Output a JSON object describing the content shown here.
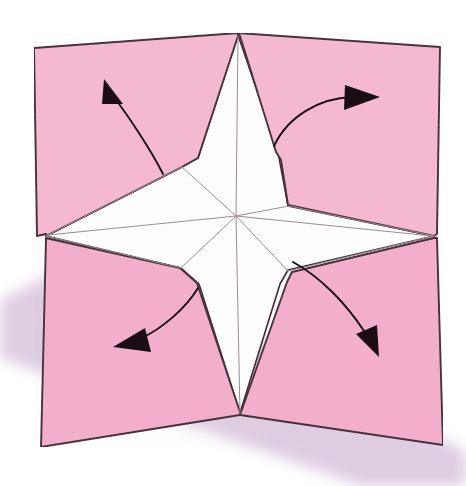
{
  "figure": {
    "kind": "origami-instruction-diagram",
    "width": 466,
    "height": 486
  },
  "colors": {
    "background": "#ffffff",
    "paper_front": "#f6b8d2",
    "paper_front_alt": "#f4aecb",
    "paper_back": "#ffffff",
    "outline": "#3d2330",
    "crease_line": "#9a8d94",
    "arrow": "#1a0d14",
    "shadow": "#d9c4dd"
  },
  "shadow": {
    "name": "drop-shadow-band",
    "points": "0,300 96,252 466,452 466,486 360,486 0,358"
  },
  "paper": {
    "corners": {
      "top_left": [
        34,
        48
      ],
      "top_center": [
        238,
        33
      ],
      "top_right": [
        440,
        47
      ],
      "right_mid": [
        434,
        236
      ],
      "bottom_right": [
        443,
        445
      ],
      "bottom_center": [
        240,
        415
      ],
      "bottom_left": [
        41,
        447
      ],
      "left_mid": [
        46,
        236
      ],
      "center": [
        236,
        216
      ]
    },
    "flaps": [
      {
        "name": "flap-top-left",
        "points": "34,48 238,33 238,36 198,158 180,168 46,236 46,234 37,236"
      },
      {
        "name": "flap-top-right",
        "points": "238,33 440,47 437,234 434,236 288,205 281,160 276,152 240,36"
      },
      {
        "name": "flap-bottom-left",
        "points": "46,238 180,268 197,283 240,412 240,415 41,447"
      },
      {
        "name": "flap-bottom-right",
        "points": "434,238 437,238 443,445 240,415 241,412 287,282 292,272"
      }
    ],
    "star": {
      "name": "white-star",
      "points": "238,35 278,152 288,206 434,236 288,270 280,284 240,413 199,284 181,268 46,236 180,168 198,158"
    },
    "creases": [
      {
        "name": "crease-vertical-top",
        "from": [
          238,
          36
        ],
        "to": [
          236,
          216
        ]
      },
      {
        "name": "crease-vertical-bottom",
        "from": [
          236,
          216
        ],
        "to": [
          240,
          413
        ]
      },
      {
        "name": "crease-diagonal-upper-left",
        "from": [
          236,
          216
        ],
        "to": [
          182,
          167
        ]
      },
      {
        "name": "crease-diagonal-upper-right",
        "from": [
          236,
          216
        ],
        "to": [
          289,
          206
        ]
      },
      {
        "name": "crease-diagonal-lower-left",
        "from": [
          236,
          216
        ],
        "to": [
          181,
          268
        ]
      },
      {
        "name": "crease-diagonal-lower-right",
        "from": [
          236,
          216
        ],
        "to": [
          288,
          271
        ]
      },
      {
        "name": "crease-horizontal-left",
        "from": [
          236,
          216
        ],
        "to": [
          48,
          235
        ]
      },
      {
        "name": "crease-horizontal-right",
        "from": [
          236,
          216
        ],
        "to": [
          432,
          236
        ]
      },
      {
        "name": "crease-arm-upper-left-edge",
        "from": [
          182,
          167
        ],
        "to": [
          46,
          236
        ]
      },
      {
        "name": "crease-arm-upper-right-edge",
        "from": [
          289,
          206
        ],
        "to": [
          434,
          236
        ]
      },
      {
        "name": "crease-arm-lower-left-edge",
        "from": [
          181,
          268
        ],
        "to": [
          46,
          236
        ]
      },
      {
        "name": "crease-arm-lower-right-edge",
        "from": [
          288,
          271
        ],
        "to": [
          434,
          236
        ]
      }
    ]
  },
  "arrows": [
    {
      "name": "arrow-top-left",
      "direction": "up-left",
      "tail": [
        163,
        174
      ],
      "path": "M163,174 C152,152 130,118 113,96",
      "head": "104,79 123,104 102,104"
    },
    {
      "name": "arrow-top-right",
      "direction": "right",
      "tail": [
        274,
        146
      ],
      "path": "M274,146 C288,116 320,98 352,97",
      "head": "380,97 344,110 345,85"
    },
    {
      "name": "arrow-bottom-left",
      "direction": "down-left",
      "tail": [
        198,
        288
      ],
      "path": "M198,288 C186,308 163,328 140,339",
      "head": "113,347 145,328 151,352"
    },
    {
      "name": "arrow-bottom-right",
      "direction": "down",
      "tail": [
        293,
        262
      ],
      "path": "M293,262 C322,278 347,305 364,331",
      "head": "379,357 356,334 377,325"
    }
  ]
}
